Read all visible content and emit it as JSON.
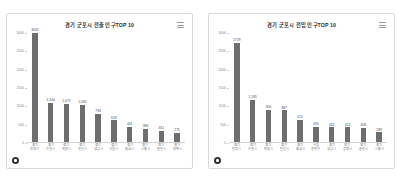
{
  "panels": [
    {
      "title": "경기 군포시 전출 인구TOP 10",
      "menu_icon": "hamburger-menu-icon",
      "badge_icon": "circle-dot-icon",
      "chart_data": {
        "type": "bar",
        "title": "경기 군포시 전출 인구TOP 10",
        "xlabel": "",
        "ylabel": "",
        "ylim": [
          0,
          3000
        ],
        "yticks": [
          0,
          500,
          1000,
          1500,
          2000,
          2500,
          3000
        ],
        "ytick_labels": [
          "0",
          "500",
          "1000",
          "1500",
          "2000",
          "2500",
          "3000"
        ],
        "grid": false,
        "legend": false,
        "bar_color": "#6e6e6e",
        "categories": [
          "경기 안양시",
          "경기 수원시",
          "경기 의왕시",
          "경기 안산시",
          "경기 성남시",
          "경기 서울시",
          "경기 화성시",
          "경기 시흥시",
          "경기 용인시",
          "경기 평택시"
        ],
        "category_lines": [
          [
            "경기",
            "안양시"
          ],
          [
            "경기",
            "수원시"
          ],
          [
            "경기",
            "의왕시"
          ],
          [
            "경기",
            "안산시"
          ],
          [
            "경기",
            "성남시"
          ],
          [
            "경기",
            "서울시"
          ],
          [
            "경기",
            "화성시"
          ],
          [
            "경기",
            "시흥시"
          ],
          [
            "경기",
            "용인시"
          ],
          [
            "경기",
            "평택시"
          ]
        ],
        "values": [
          3002,
          1104,
          1071,
          1035,
          794,
          618,
          441,
          386,
          341,
          275
        ],
        "value_labels": [
          "3002",
          "1,104",
          "1,071",
          "1,035",
          "794",
          "618",
          "441",
          "386",
          "341",
          "275"
        ]
      }
    },
    {
      "title": "경기 군포시 전입 인구TOP 10",
      "menu_icon": "hamburger-menu-icon",
      "badge_icon": "circle-dot-icon",
      "chart_data": {
        "type": "bar",
        "title": "경기 군포시 전입 인구TOP 10",
        "xlabel": "",
        "ylabel": "",
        "ylim": [
          0,
          3000
        ],
        "yticks": [
          0,
          500,
          1000,
          1500,
          2000,
          2500,
          3000
        ],
        "ytick_labels": [
          "0",
          "500",
          "1000",
          "1500",
          "2000",
          "2500",
          "3000"
        ],
        "grid": false,
        "legend": false,
        "bar_color": "#6e6e6e",
        "categories": [
          "경기 안양시",
          "경기 수원시",
          "경기 의왕시",
          "경기 안산시",
          "경기 화성시",
          "서울 관악구",
          "경기 성남시",
          "경기 광명시",
          "경기 용인시",
          "경기 시흥시"
        ],
        "category_lines": [
          [
            "경기",
            "안양시"
          ],
          [
            "경기",
            "수원시"
          ],
          [
            "경기",
            "의왕시"
          ],
          [
            "경기",
            "안산시"
          ],
          [
            "경기",
            "화성시"
          ],
          [
            "서울",
            "관악구"
          ],
          [
            "경기",
            "성남시"
          ],
          [
            "경기",
            "광명시"
          ],
          [
            "경기",
            "용인시"
          ],
          [
            "경기",
            "시흥시"
          ]
        ],
        "values": [
          2729,
          1185,
          900,
          887,
          621,
          430,
          424,
          424,
          408,
          289
        ],
        "value_labels": [
          "2729",
          "1,185",
          "900",
          "887",
          "621",
          "430",
          "424",
          "424",
          "408",
          "289"
        ]
      }
    }
  ]
}
